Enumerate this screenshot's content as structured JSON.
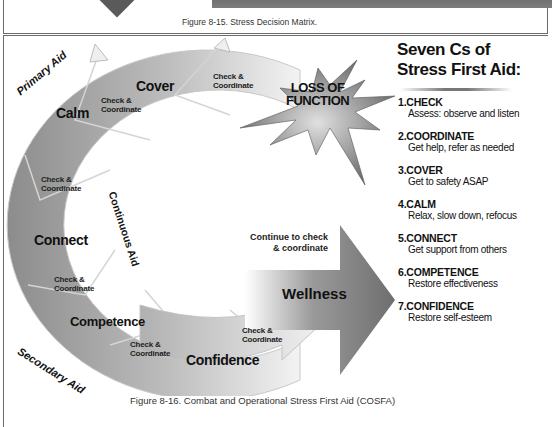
{
  "top_figure": {
    "caption": "Figure 8-15. Stress Decision Matrix."
  },
  "diagram": {
    "side_labels": {
      "primary": "Primary Aid",
      "continuous": "Continuous Aid",
      "secondary": "Secondary Aid"
    },
    "stages": {
      "cover": "Cover",
      "calm": "Calm",
      "connect": "Connect",
      "competence": "Competence",
      "confidence": "Confidence"
    },
    "check_coordinate": {
      "line1": "Check &",
      "line2": "Coordinate"
    },
    "loss_of_function": {
      "line1": "LOSS OF",
      "line2": "FUNCTION"
    },
    "continue_text": {
      "line1": "Continue to check",
      "line2": "& coordinate"
    },
    "wellness": "Wellness",
    "colors": {
      "arc_dark": "#8a8a8a",
      "arc_light": "#e6e6e6",
      "starburst": "#7a7a7a",
      "arrow_dark": "#777777"
    }
  },
  "seven_cs": {
    "title_line1": "Seven Cs of",
    "title_line2": "Stress First Aid:",
    "items": [
      {
        "head": "1.CHECK",
        "desc": "Assess: observe and listen"
      },
      {
        "head": "2.COORDINATE",
        "desc": "Get help, refer as needed"
      },
      {
        "head": "3.COVER",
        "desc": "Get to safety ASAP"
      },
      {
        "head": "4.CALM",
        "desc": "Relax, slow down, refocus"
      },
      {
        "head": "5.CONNECT",
        "desc": "Get support from others"
      },
      {
        "head": "6.COMPETENCE",
        "desc": "Restore effectiveness"
      },
      {
        "head": "7.CONFIDENCE",
        "desc": "Restore self-esteem"
      }
    ]
  },
  "bottom_figure": {
    "caption": "Figure 8-16. Combat and Operational Stress First Aid (COSFA)"
  }
}
